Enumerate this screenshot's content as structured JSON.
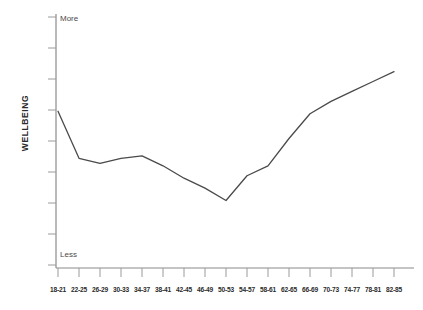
{
  "chart_data": {
    "type": "line",
    "title": "",
    "subtitle": "",
    "xlabel": "",
    "ylabel": "WELLBEING",
    "categories": [
      "18-21",
      "22-25",
      "26-29",
      "30-33",
      "34-37",
      "38-41",
      "42-45",
      "46-49",
      "50-53",
      "54-57",
      "58-61",
      "62-65",
      "66-69",
      "70-73",
      "74-77",
      "78-81",
      "82-85"
    ],
    "values": [
      62,
      43,
      41,
      43,
      44,
      40,
      35,
      31,
      26,
      36,
      40,
      51,
      61,
      66,
      70,
      74,
      78
    ],
    "y_axis": {
      "low_label": "Less",
      "high_label": "More",
      "tick_count": 9,
      "ylim": [
        0,
        100
      ],
      "numeric_ticks_shown": false
    },
    "grid": false,
    "legend": false,
    "legend_position": "none",
    "series": [
      {
        "name": "Wellbeing by age",
        "values": [
          62,
          43,
          41,
          43,
          44,
          40,
          35,
          31,
          26,
          36,
          40,
          51,
          61,
          66,
          70,
          74,
          78
        ]
      }
    ],
    "annotations": [],
    "colors": {
      "line": "#4a4a4a",
      "axis": "#8a8a8a",
      "text": "#2b2b2b",
      "background": "#ffffff"
    }
  },
  "axes": {
    "y_title": "WELLBEING",
    "y_high": "More",
    "y_low": "Less"
  }
}
